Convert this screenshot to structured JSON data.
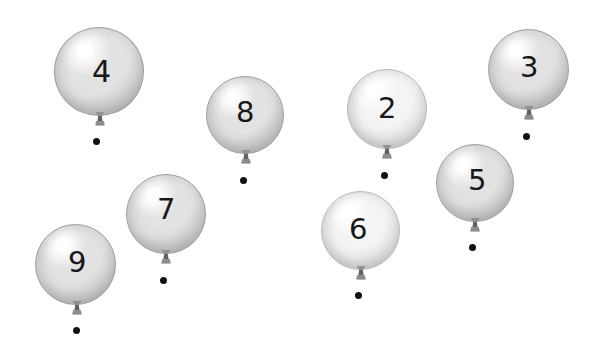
{
  "page": {
    "background_color": "#ffffff",
    "width": 602,
    "height": 352
  },
  "style": {
    "balloon_light": "#ffffff",
    "balloon_mid": "#e2e2e2",
    "balloon_shade": "#bdbdbd",
    "balloon_edge": "#9a9a9a",
    "pale_light": "#ffffff",
    "pale_mid": "#f4f4f4",
    "pale_shade": "#dcdcdc",
    "pale_edge": "#b4b4b4",
    "knot_color": "#8d8d8d",
    "knot_dark": "#616161",
    "dot_color": "#101114",
    "number_color": "#17181a"
  },
  "balloons": [
    {
      "id": "balloon-4",
      "label": "4",
      "tone": "gray",
      "x": 54,
      "y": 27,
      "w": 90,
      "h": 89,
      "number_size": 30,
      "number_dx": 38,
      "number_dy": 30,
      "knot_dx": 37,
      "knot_dy": 84,
      "dot_dx": 39,
      "dot_dy": 111,
      "dot_size": 7
    },
    {
      "id": "balloon-8",
      "label": "8",
      "tone": "gray",
      "x": 206,
      "y": 76,
      "w": 78,
      "h": 78,
      "number_size": 29,
      "number_dx": 30,
      "number_dy": 22,
      "knot_dx": 31,
      "knot_dy": 73,
      "dot_dx": 34,
      "dot_dy": 101,
      "dot_size": 7
    },
    {
      "id": "balloon-2",
      "label": "2",
      "tone": "pale",
      "x": 347,
      "y": 69,
      "w": 80,
      "h": 80,
      "number_size": 29,
      "number_dx": 31,
      "number_dy": 25,
      "knot_dx": 31,
      "knot_dy": 75,
      "dot_dx": 34,
      "dot_dy": 103,
      "dot_size": 7
    },
    {
      "id": "balloon-3",
      "label": "3",
      "tone": "gray",
      "x": 488,
      "y": 29,
      "w": 81,
      "h": 81,
      "number_size": 29,
      "number_dx": 32,
      "number_dy": 24,
      "knot_dx": 32,
      "knot_dy": 76,
      "dot_dx": 35,
      "dot_dy": 104,
      "dot_size": 7
    },
    {
      "id": "balloon-5",
      "label": "5",
      "tone": "gray",
      "x": 436,
      "y": 144,
      "w": 78,
      "h": 78,
      "number_size": 29,
      "number_dx": 32,
      "number_dy": 22,
      "knot_dx": 30,
      "knot_dy": 73,
      "dot_dx": 33,
      "dot_dy": 100,
      "dot_size": 7
    },
    {
      "id": "balloon-7",
      "label": "7",
      "tone": "gray",
      "x": 126,
      "y": 174,
      "w": 80,
      "h": 80,
      "number_size": 29,
      "number_dx": 31,
      "number_dy": 21,
      "knot_dx": 31,
      "knot_dy": 75,
      "dot_dx": 34,
      "dot_dy": 103,
      "dot_size": 7
    },
    {
      "id": "balloon-6",
      "label": "6",
      "tone": "pale",
      "x": 321,
      "y": 191,
      "w": 79,
      "h": 79,
      "number_size": 29,
      "number_dx": 28,
      "number_dy": 24,
      "knot_dx": 31,
      "knot_dy": 74,
      "dot_dx": 34,
      "dot_dy": 101,
      "dot_size": 7
    },
    {
      "id": "balloon-9",
      "label": "9",
      "tone": "gray",
      "x": 35,
      "y": 224,
      "w": 81,
      "h": 81,
      "number_size": 29,
      "number_dx": 33,
      "number_dy": 24,
      "knot_dx": 33,
      "knot_dy": 76,
      "dot_dx": 38,
      "dot_dy": 103,
      "dot_size": 7
    }
  ]
}
